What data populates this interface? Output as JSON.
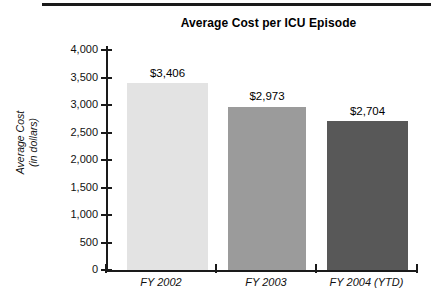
{
  "chart_data": {
    "type": "bar",
    "title": "Average Cost per ICU Episode",
    "xlabel": "",
    "ylabel": "Average Cost\n(in dollars)",
    "ylabel_line1": "Average Cost",
    "ylabel_line2": "(in dollars)",
    "categories": [
      "FY 2002",
      "FY 2003",
      "FY 2004 (YTD)"
    ],
    "values": [
      3406,
      2973,
      2704
    ],
    "value_labels": [
      "$3,406",
      "$2,973",
      "$2,704"
    ],
    "bar_colors": [
      "#e3e3e3",
      "#9b9b9b",
      "#585858"
    ],
    "ylim": [
      0,
      4000
    ],
    "ytick_values": [
      4000,
      3500,
      3000,
      2500,
      2000,
      1500,
      1000,
      500,
      0
    ],
    "ytick_labels": [
      "4,000",
      "3,500",
      "3,000",
      "2,500",
      "2,000",
      "1,500",
      "1,000",
      "500",
      "0"
    ],
    "grid": false,
    "legend": false,
    "axis_color": "#1a1a1a"
  },
  "figure": {
    "top_rule_color": "#1a1a1a"
  }
}
